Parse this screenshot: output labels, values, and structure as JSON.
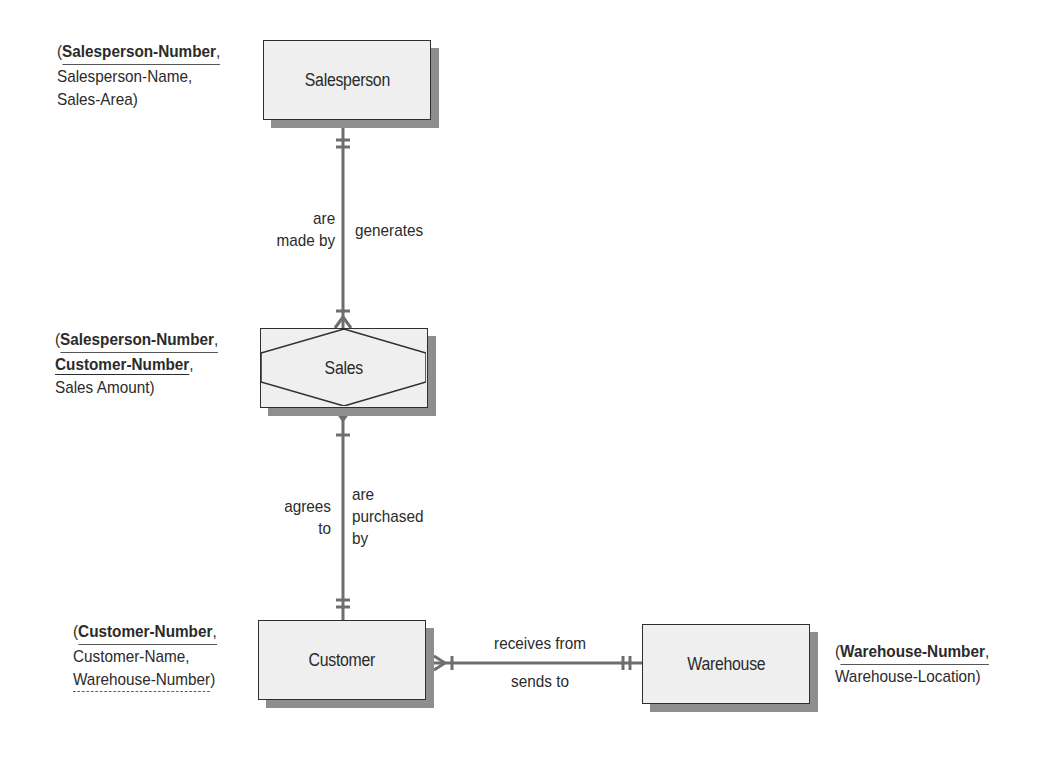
{
  "diagram": {
    "type": "entity-relationship",
    "entities": [
      {
        "id": "salesperson",
        "name": "Salesperson",
        "kind": "entity",
        "attributes_text": [
          "(",
          "Salesperson-Number",
          ",",
          "Salesperson-Name,",
          "Sales-Area)"
        ],
        "primary_keys": [
          "Salesperson-Number"
        ],
        "attributes": [
          "Salesperson-Number",
          "Salesperson-Name",
          "Sales-Area"
        ]
      },
      {
        "id": "sales",
        "name": "Sales",
        "kind": "associative-entity",
        "primary_keys": [
          "Salesperson-Number",
          "Customer-Number"
        ],
        "attributes": [
          "Salesperson-Number",
          "Customer-Number",
          "Sales Amount"
        ]
      },
      {
        "id": "customer",
        "name": "Customer",
        "kind": "entity",
        "primary_keys": [
          "Customer-Number"
        ],
        "foreign_keys": [
          "Warehouse-Number"
        ],
        "attributes": [
          "Customer-Number",
          "Customer-Name",
          "Warehouse-Number"
        ]
      },
      {
        "id": "warehouse",
        "name": "Warehouse",
        "kind": "entity",
        "primary_keys": [
          "Warehouse-Number"
        ],
        "attributes": [
          "Warehouse-Number",
          "Warehouse-Location"
        ]
      }
    ],
    "relationships": [
      {
        "from": "salesperson",
        "to": "sales",
        "from_cardinality": "one-and-only-one",
        "to_cardinality": "one-or-many",
        "label_left": "are made by",
        "label_right": "generates"
      },
      {
        "from": "sales",
        "to": "customer",
        "from_cardinality": "one-or-many",
        "to_cardinality": "one-and-only-one",
        "label_left": "agrees to",
        "label_right": "are purchased by"
      },
      {
        "from": "customer",
        "to": "warehouse",
        "from_cardinality": "one-or-many",
        "to_cardinality": "one-and-only-one",
        "label_top": "receives from",
        "label_bottom": "sends to"
      }
    ]
  },
  "labels": {
    "salesperson": {
      "name": "Salesperson",
      "attr_open": "(",
      "attr_pk1": "Salesperson-Number",
      "attr_comma1": ",",
      "attr_line2": "Salesperson-Name,",
      "attr_line3": "Sales-Area)"
    },
    "sales": {
      "name": "Sales",
      "attr_open": "(",
      "attr_pk1": "Salesperson-Number",
      "attr_comma1": ",",
      "attr_pk2": "Customer-Number",
      "attr_comma2": ",",
      "attr_line3": "Sales Amount)"
    },
    "customer": {
      "name": "Customer",
      "attr_open": "(",
      "attr_pk1": "Customer-Number",
      "attr_comma1": ",",
      "attr_line2": "Customer-Name,",
      "attr_fk": "Warehouse-Number",
      "attr_close": ")"
    },
    "warehouse": {
      "name": "Warehouse",
      "attr_open": "(",
      "attr_pk1": "Warehouse-Number",
      "attr_comma1": ",",
      "attr_line2": "Warehouse-Location)"
    },
    "rel_salesperson_sales": {
      "left_1": "are",
      "left_2": "made by",
      "right": "generates"
    },
    "rel_sales_customer": {
      "left_1": "agrees",
      "left_2": "to",
      "right_1": "are",
      "right_2": "purchased",
      "right_3": "by"
    },
    "rel_customer_warehouse": {
      "top": "receives from",
      "bottom": "sends to"
    }
  },
  "colors": {
    "entity_fill": "#efefef",
    "entity_border": "#2f2f2f",
    "shadow": "#8e8e8e",
    "connector": "#6e6e6e",
    "text": "#2b2b2b"
  }
}
